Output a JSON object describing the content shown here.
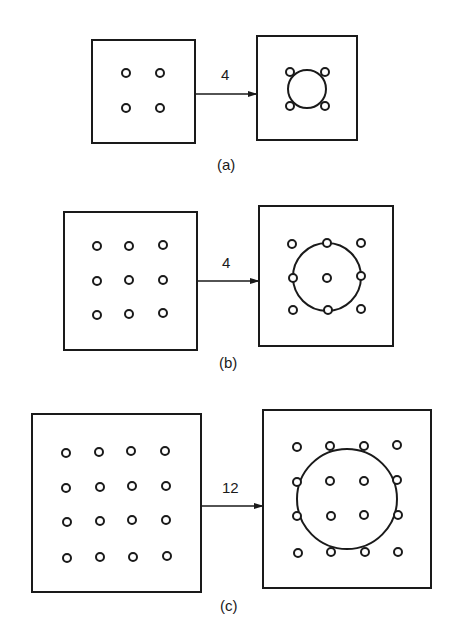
{
  "diagram": {
    "panels": [
      {
        "id": "a",
        "label": "(a)",
        "arrow_label": "4",
        "left_grid": {
          "rows": 2,
          "cols": 2
        },
        "right_pattern": "4 holes around a central circle"
      },
      {
        "id": "b",
        "label": "(b)",
        "arrow_label": "4",
        "left_grid": {
          "rows": 3,
          "cols": 3
        },
        "right_pattern": "3x3 holes with circle through edge-midpoint holes"
      },
      {
        "id": "c",
        "label": "(c)",
        "arrow_label": "12",
        "left_grid": {
          "rows": 4,
          "cols": 4
        },
        "right_pattern": "4x4 holes with circle through outer middle holes"
      }
    ],
    "colors": {
      "line": "#1a1a1a",
      "background": "#ffffff"
    }
  }
}
